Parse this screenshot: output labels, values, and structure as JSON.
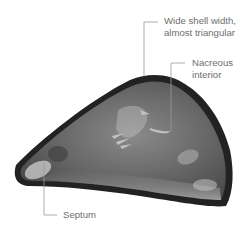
{
  "figure": {
    "colors": {
      "background": "#ffffff",
      "shell_rim": "#1e1e1e",
      "shell_interior": "#6a6a6a",
      "shell_highlight": "#c8c8c8",
      "leader_line": "#9a9a9a",
      "label_text": "#6e6e6e"
    }
  },
  "annotations": [
    {
      "id": "shell-width",
      "lines": [
        "Wide shell width,",
        "almost triangular"
      ]
    },
    {
      "id": "nacreous",
      "lines": [
        "Nacreous",
        "interior"
      ]
    },
    {
      "id": "septum",
      "lines": [
        "Septum"
      ]
    }
  ]
}
